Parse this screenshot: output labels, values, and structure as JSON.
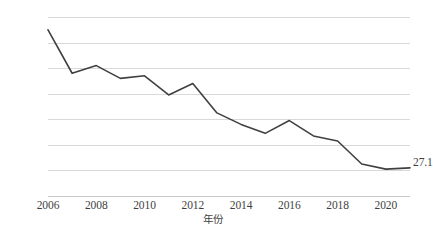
{
  "chart_data": {
    "type": "line",
    "title": "",
    "subtitle": "",
    "xlabel": "年份",
    "ylabel": "收入占比（%）",
    "x": [
      2006,
      2007,
      2008,
      2009,
      2010,
      2011,
      2012,
      2013,
      2014,
      2015,
      2016,
      2017,
      2018,
      2019,
      2020,
      2021
    ],
    "values": [
      32.5,
      30.8,
      31.1,
      30.6,
      30.7,
      29.95,
      30.4,
      29.25,
      28.8,
      28.45,
      28.95,
      28.35,
      28.15,
      27.25,
      27.05,
      27.1
    ],
    "series": [
      {
        "name": "收入占比",
        "values": [
          32.5,
          30.8,
          31.1,
          30.6,
          30.7,
          29.95,
          30.4,
          29.25,
          28.8,
          28.45,
          28.95,
          28.35,
          28.15,
          27.25,
          27.05,
          27.1
        ],
        "color": "#404040"
      }
    ],
    "xlim": [
      2006,
      2021
    ],
    "ylim": [
      26,
      33
    ],
    "ytick_labels": [
      "33",
      "32",
      "31",
      "30",
      "29",
      "28",
      "27",
      "26"
    ],
    "ytick_values": [
      33,
      32,
      31,
      30,
      29,
      28,
      27,
      26
    ],
    "xtick_labels": [
      "2006",
      "2008",
      "2010",
      "2012",
      "2014",
      "2016",
      "2018",
      "2020"
    ],
    "xtick_values": [
      2006,
      2008,
      2010,
      2012,
      2014,
      2016,
      2018,
      2020
    ],
    "grid": "horizontal",
    "gridline_color": "#d9d9d9",
    "legend": "none",
    "legend_position": "none",
    "annotations": [
      {
        "name": "end-value-label",
        "text": "27.1",
        "x": 2021,
        "y": 27.1
      }
    ],
    "background_color": "#ffffff",
    "text_color": "#3f3f3f"
  }
}
